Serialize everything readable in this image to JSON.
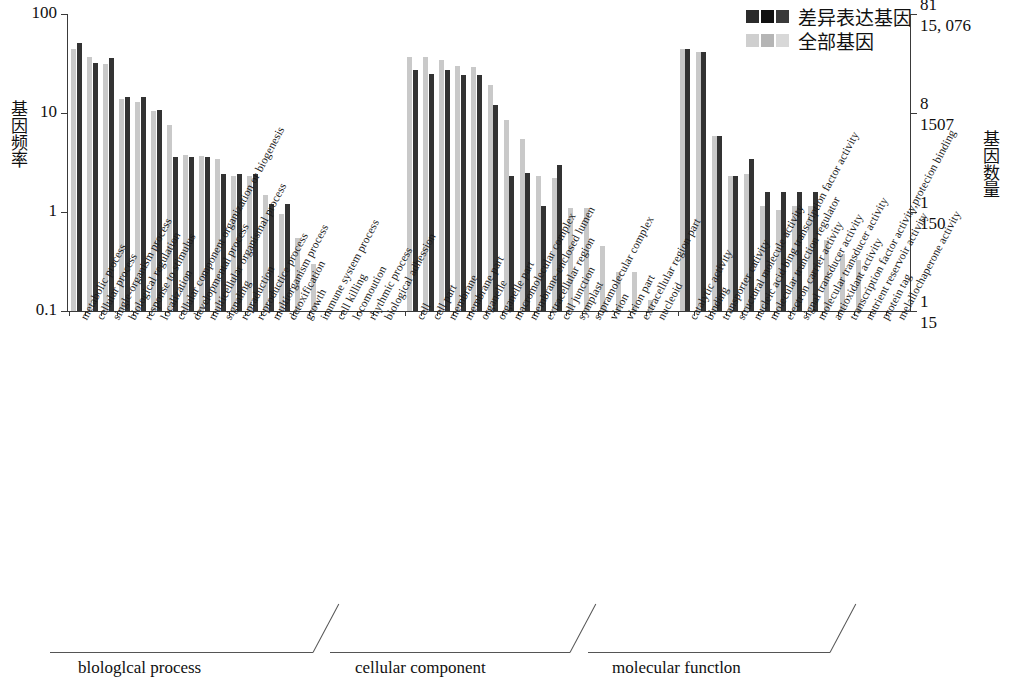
{
  "legend": {
    "position": "top-right",
    "entries": [
      {
        "label": "差异表达基因",
        "color": "#333333",
        "key": "deg"
      },
      {
        "label": "全部基因",
        "color": "#c9c9c9",
        "key": "all"
      }
    ]
  },
  "axes": {
    "left_title": "基因频率",
    "right_title": "基因数量",
    "left_ticks": [
      "100",
      "10",
      "1",
      "0.1"
    ],
    "right_ticks_outer": [
      "81",
      "8",
      "1",
      "1"
    ],
    "right_ticks_inner": [
      "15, 076",
      "1507",
      "150",
      "15"
    ]
  },
  "groups": [
    {
      "key": "bp",
      "label": "blologlcal process"
    },
    {
      "key": "cc",
      "label": "cellular component"
    },
    {
      "key": "mf",
      "label": "molecular functlon"
    }
  ],
  "chart_data": {
    "type": "bar",
    "title": "",
    "xlabel": "",
    "ylabel": "基因频率",
    "y2label": "基因数量",
    "yscale": "log",
    "ylim": [
      0.1,
      100
    ],
    "ytick_values": [
      100,
      10,
      1,
      0.1
    ],
    "grid": false,
    "legend_position": "top-right",
    "series": [
      {
        "name": "全部基因",
        "key": "all",
        "color": "#c9c9c9"
      },
      {
        "name": "差异表达基因",
        "key": "deg",
        "color": "#333333"
      }
    ],
    "groups": [
      "blologlcal process",
      "cellular component",
      "molecular functlon"
    ],
    "categories": [
      {
        "group": "bp",
        "label": "metabolic process",
        "all": 44.0,
        "deg": 51.0
      },
      {
        "group": "bp",
        "label": "cellular process",
        "all": 37.0,
        "deg": 32.0
      },
      {
        "group": "bp",
        "label": "single-organism process",
        "all": 31.0,
        "deg": 36.0
      },
      {
        "group": "bp",
        "label": "biological regulation",
        "all": 14.0,
        "deg": 14.5
      },
      {
        "group": "bp",
        "label": "response to stimulus",
        "all": 13.0,
        "deg": 14.5
      },
      {
        "group": "bp",
        "label": "localization",
        "all": 10.5,
        "deg": 10.8
      },
      {
        "group": "bp",
        "label": "cellular component organization or biogenesis",
        "all": 7.6,
        "deg": 3.6
      },
      {
        "group": "bp",
        "label": "developmental process",
        "all": 3.8,
        "deg": 3.6
      },
      {
        "group": "bp",
        "label": "multicellular organismal process",
        "all": 3.7,
        "deg": 3.6
      },
      {
        "group": "bp",
        "label": "signaling",
        "all": 3.4,
        "deg": 2.4
      },
      {
        "group": "bp",
        "label": "repraduction",
        "all": 2.3,
        "deg": 2.4
      },
      {
        "group": "bp",
        "label": "reproductice process",
        "all": 2.3,
        "deg": 2.4
      },
      {
        "group": "bp",
        "label": "multiorganism process",
        "all": 1.5,
        "deg": 1.2
      },
      {
        "group": "bp",
        "label": "detoxification",
        "all": 0.95,
        "deg": 1.2
      },
      {
        "group": "bp",
        "label": "growth",
        "all": 0.55,
        "deg": 0.0
      },
      {
        "group": "bp",
        "label": "immune system process",
        "all": 0.3,
        "deg": 0.0
      },
      {
        "group": "bp",
        "label": "cell killing",
        "all": 0.0,
        "deg": 0.0
      },
      {
        "group": "bp",
        "label": "locomoution",
        "all": 0.0,
        "deg": 0.0
      },
      {
        "group": "bp",
        "label": "rhythmic process",
        "all": 0.0,
        "deg": 0.0
      },
      {
        "group": "bp",
        "label": "biological adhession",
        "all": 0.0,
        "deg": 0.0
      },
      {
        "group": "cc",
        "label": "cell",
        "all": 37.0,
        "deg": 27.0
      },
      {
        "group": "cc",
        "label": "cell part",
        "all": 37.0,
        "deg": 25.0
      },
      {
        "group": "cc",
        "label": "membrane",
        "all": 34.0,
        "deg": 27.0
      },
      {
        "group": "cc",
        "label": "membrane part",
        "all": 30.0,
        "deg": 24.0
      },
      {
        "group": "cc",
        "label": "organelle",
        "all": 29.0,
        "deg": 24.0
      },
      {
        "group": "cc",
        "label": "organelle part",
        "all": 19.0,
        "deg": 12.0
      },
      {
        "group": "cc",
        "label": "macromolecular complex",
        "all": 8.6,
        "deg": 2.3
      },
      {
        "group": "cc",
        "label": "membrane-enclosed lumen",
        "all": 5.5,
        "deg": 2.5
      },
      {
        "group": "cc",
        "label": "extracellular region",
        "all": 2.3,
        "deg": 1.15
      },
      {
        "group": "cc",
        "label": "cell junction",
        "all": 2.2,
        "deg": 3.0
      },
      {
        "group": "cc",
        "label": "symplast",
        "all": 1.1,
        "deg": 0.0
      },
      {
        "group": "cc",
        "label": "supramolecular complex",
        "all": 1.1,
        "deg": 0.0
      },
      {
        "group": "cc",
        "label": "virion",
        "all": 0.45,
        "deg": 0.0
      },
      {
        "group": "cc",
        "label": "virion part",
        "all": 0.25,
        "deg": 0.0
      },
      {
        "group": "cc",
        "label": "extracellular region part",
        "all": 0.25,
        "deg": 0.0
      },
      {
        "group": "cc",
        "label": "nucleoid",
        "all": 0.13,
        "deg": 0.0
      },
      {
        "group": "mf",
        "label": "catalytic activity",
        "all": 44.0,
        "deg": 44.0
      },
      {
        "group": "mf",
        "label": "binding",
        "all": 41.0,
        "deg": 41.0
      },
      {
        "group": "mf",
        "label": "transporter cativity",
        "all": 5.8,
        "deg": 5.8
      },
      {
        "group": "mf",
        "label": "structural molecule activity",
        "all": 2.3,
        "deg": 2.3
      },
      {
        "group": "mf",
        "label": "nucleic acid bing transcription factor activity",
        "all": 2.4,
        "deg": 3.4
      },
      {
        "group": "mf",
        "label": "molecular trunction regulator",
        "all": 1.15,
        "deg": 1.6
      },
      {
        "group": "mf",
        "label": "electron carrier activity",
        "all": 1.05,
        "deg": 1.6
      },
      {
        "group": "mf",
        "label": "signal transducer activity",
        "all": 1.15,
        "deg": 1.6
      },
      {
        "group": "mf",
        "label": "molecular transducer activity",
        "all": 1.15,
        "deg": 1.6
      },
      {
        "group": "mf",
        "label": "antioxidant activity",
        "all": 0.52,
        "deg": 0.0
      },
      {
        "group": "mf",
        "label": "transcription factor activity,protecion binding",
        "all": 0.38,
        "deg": 0.0
      },
      {
        "group": "mf",
        "label": "nutrient reservoir activity",
        "all": 0.33,
        "deg": 0.0
      },
      {
        "group": "mf",
        "label": "protein tag",
        "all": 0.0,
        "deg": 0.0
      },
      {
        "group": "mf",
        "label": "melallochaperone activity",
        "all": 0.0,
        "deg": 0.0
      }
    ]
  }
}
